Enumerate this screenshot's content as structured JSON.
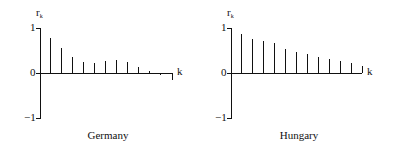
{
  "chart_data": [
    {
      "type": "bar",
      "title": "Germany",
      "xlabel": "k",
      "ylabel": "r_k",
      "ylim": [
        -1,
        1
      ],
      "yticks": [
        "1",
        "0",
        "−1"
      ],
      "categories": [
        1,
        2,
        3,
        4,
        5,
        6,
        7,
        8,
        9,
        10,
        11
      ],
      "values": [
        0.78,
        0.56,
        0.36,
        0.24,
        0.22,
        0.27,
        0.29,
        0.24,
        0.13,
        0.04,
        -0.04
      ]
    },
    {
      "type": "bar",
      "title": "Hungary",
      "xlabel": "k",
      "ylabel": "r_k",
      "ylim": [
        -1,
        1
      ],
      "yticks": [
        "1",
        "0",
        "−1"
      ],
      "categories": [
        1,
        2,
        3,
        4,
        5,
        6,
        7,
        8,
        9,
        10,
        11,
        12
      ],
      "values": [
        0.87,
        0.76,
        0.71,
        0.67,
        0.53,
        0.47,
        0.42,
        0.36,
        0.31,
        0.27,
        0.22,
        0.16
      ]
    }
  ],
  "labels": {
    "r": "r",
    "k_sub": "k",
    "k": "k",
    "one": "1",
    "zero": "0",
    "minus_one": "−1"
  }
}
